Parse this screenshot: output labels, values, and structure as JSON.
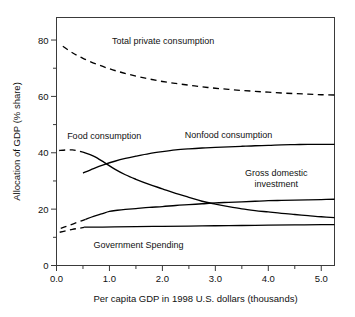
{
  "chart_data": {
    "type": "line",
    "title": "",
    "xlabel": "Per capita GDP in 1998 U.S. dollars (thousands)",
    "ylabel": "Allocation of GDP (% share)",
    "xlim": [
      0.0,
      5.25
    ],
    "ylim": [
      0,
      88
    ],
    "grid": false,
    "legend_position": "inline-annotations",
    "x_ticks_major": [
      "0.0",
      "1.0",
      "2.0",
      "3.0",
      "4.0",
      "5.0"
    ],
    "x_ticks_major_values": [
      0.0,
      1.0,
      2.0,
      3.0,
      4.0,
      5.0
    ],
    "x_ticks_minor_values": [
      0.5,
      1.5,
      2.5,
      3.5,
      4.5
    ],
    "y_ticks_major": [
      "0",
      "20",
      "40",
      "60",
      "80"
    ],
    "y_ticks_major_values": [
      0,
      20,
      40,
      60,
      80
    ],
    "y_ticks_minor_values": [
      10,
      30,
      50,
      70
    ],
    "series": [
      {
        "name": "Total private consumption",
        "style": "dashed",
        "label_x": 1.05,
        "label_y": 80,
        "x": [
          0.12,
          0.3,
          0.5,
          0.75,
          1.0,
          1.25,
          1.5,
          1.75,
          2.0,
          2.25,
          2.5,
          2.75,
          3.0,
          3.25,
          3.5,
          3.75,
          4.0,
          4.25,
          4.5,
          4.75,
          5.0,
          5.25
        ],
        "y": [
          77.8,
          75.5,
          73.5,
          71.5,
          69.8,
          68.4,
          67.2,
          66.2,
          65.3,
          64.6,
          64.0,
          63.4,
          62.9,
          62.5,
          62.1,
          61.8,
          61.5,
          61.2,
          61.0,
          60.8,
          60.6,
          60.5
        ]
      },
      {
        "name": "Food consumption (dashed head)",
        "style": "dashed",
        "x": [
          0.05,
          0.18,
          0.3,
          0.4,
          0.5
        ],
        "y": [
          40.8,
          41.0,
          41.0,
          40.7,
          40.2
        ]
      },
      {
        "name": "Food consumption",
        "style": "solid",
        "label_x": 0.9,
        "label_y": 46,
        "x": [
          0.5,
          0.7,
          0.9,
          1.1,
          1.3,
          1.5,
          1.75,
          2.0,
          2.25,
          2.5,
          2.75,
          3.0,
          3.25,
          3.5,
          3.75,
          4.0,
          4.25,
          4.5,
          4.75,
          5.0,
          5.25
        ],
        "y": [
          40.2,
          38.8,
          36.6,
          34.2,
          32.2,
          30.6,
          28.8,
          27.2,
          25.6,
          24.2,
          22.8,
          21.8,
          20.9,
          20.1,
          19.5,
          19.0,
          18.5,
          18.1,
          17.7,
          17.3,
          17.0
        ]
      },
      {
        "name": "Nonfood consumption",
        "style": "solid",
        "label_x": 3.05,
        "label_y": 46,
        "x": [
          0.5,
          0.7,
          0.9,
          1.1,
          1.3,
          1.5,
          1.75,
          2.0,
          2.25,
          2.5,
          2.75,
          3.0,
          3.25,
          3.5,
          3.75,
          4.0,
          4.25,
          4.5,
          4.75,
          5.0,
          5.25
        ],
        "y": [
          32.8,
          34.4,
          35.8,
          37.0,
          38.0,
          38.8,
          39.7,
          40.4,
          41.0,
          41.4,
          41.7,
          41.9,
          42.1,
          42.3,
          42.5,
          42.6,
          42.8,
          42.9,
          43.0,
          43.0,
          43.0
        ]
      },
      {
        "name": "Gross domestic investment (dashed head)",
        "style": "dashed",
        "x": [
          0.08,
          0.2,
          0.32,
          0.45,
          0.55
        ],
        "y": [
          13.2,
          14.0,
          14.8,
          15.7,
          16.4
        ]
      },
      {
        "name": "Gross domestic investment",
        "style": "solid",
        "label_x": 4.05,
        "label_y": 31.5,
        "x": [
          0.55,
          0.7,
          0.85,
          1.0,
          1.15,
          1.3,
          1.5,
          1.75,
          2.0,
          2.25,
          2.5,
          2.75,
          3.0,
          3.25,
          3.5,
          3.75,
          4.0,
          4.25,
          4.5,
          4.75,
          5.0,
          5.25
        ],
        "y": [
          16.4,
          17.4,
          18.3,
          19.2,
          19.6,
          19.9,
          20.2,
          20.6,
          20.9,
          21.3,
          21.6,
          21.9,
          22.2,
          22.4,
          22.6,
          22.8,
          23.0,
          23.1,
          23.2,
          23.3,
          23.4,
          23.5
        ]
      },
      {
        "name": "Government Spending (dashed head)",
        "style": "dashed",
        "x": [
          0.06,
          0.18,
          0.3,
          0.42,
          0.52
        ],
        "y": [
          11.8,
          12.3,
          12.8,
          13.2,
          13.5
        ]
      },
      {
        "name": "Government Spending",
        "style": "solid",
        "label_x": 1.1,
        "label_y": 7.5,
        "x": [
          0.52,
          0.8,
          1.1,
          1.5,
          2.0,
          2.5,
          3.0,
          3.5,
          4.0,
          4.5,
          5.0,
          5.25
        ],
        "y": [
          13.6,
          13.6,
          13.7,
          13.8,
          13.9,
          14.0,
          14.1,
          14.2,
          14.3,
          14.4,
          14.5,
          14.5
        ]
      }
    ],
    "annotations": [
      {
        "text": "Total private consumption",
        "x": 1.05,
        "y": 80,
        "anchor": "start"
      },
      {
        "text": "Food consumption",
        "x": 0.9,
        "y": 46,
        "anchor": "middle"
      },
      {
        "text": "Nonfood consumption",
        "x": 3.25,
        "y": 46.5,
        "anchor": "middle"
      },
      {
        "text": "Gross domestic",
        "x": 4.15,
        "y": 33,
        "anchor": "middle"
      },
      {
        "text": "investment",
        "x": 4.15,
        "y": 29,
        "anchor": "middle"
      },
      {
        "text": "Government Spending",
        "x": 1.55,
        "y": 7.5,
        "anchor": "middle"
      }
    ]
  }
}
